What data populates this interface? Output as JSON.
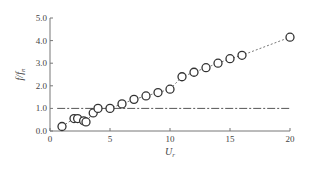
{
  "chart_data": {
    "type": "scatter",
    "title": "",
    "xlabel": "U_r",
    "ylabel": "f/f_n",
    "xlabel_main": "U",
    "xlabel_sub": "r",
    "ylabel_main": "f/f",
    "ylabel_sub": "n",
    "xlim": [
      0,
      20
    ],
    "ylim": [
      0,
      5
    ],
    "xticks": [
      0,
      5,
      10,
      15,
      20
    ],
    "yticks": [
      0.0,
      1.0,
      2.0,
      3.0,
      4.0,
      5.0
    ],
    "xtick_labels": [
      "0",
      "5",
      "10",
      "15",
      "20"
    ],
    "ytick_labels": [
      "0.0",
      "1.0",
      "2.0",
      "3.0",
      "4.0",
      "5.0"
    ],
    "grid": false,
    "legend": null,
    "series": [
      {
        "name": "measured",
        "marker": "open-circle",
        "x": [
          1.0,
          2.0,
          2.3,
          2.8,
          3.0,
          3.6,
          4.0,
          5.0,
          6.0,
          7.0,
          8.0,
          9.0,
          10.0,
          11.0,
          12.0,
          13.0,
          14.0,
          15.0,
          16.0,
          20.0
        ],
        "y": [
          0.2,
          0.55,
          0.55,
          0.45,
          0.4,
          0.8,
          1.0,
          1.0,
          1.2,
          1.4,
          1.55,
          1.7,
          1.85,
          2.4,
          2.6,
          2.8,
          3.0,
          3.2,
          3.35,
          4.15
        ]
      }
    ],
    "reference_lines": [
      {
        "name": "f/fn = 1",
        "style": "dash-dot",
        "y": 1.0,
        "x_range": [
          0.6,
          20
        ]
      },
      {
        "name": "trend",
        "style": "dashed",
        "connects_points": true
      }
    ]
  },
  "colors": {
    "axis": "#777777",
    "marker": "#333333",
    "line": "#555555",
    "text": "#444444"
  }
}
